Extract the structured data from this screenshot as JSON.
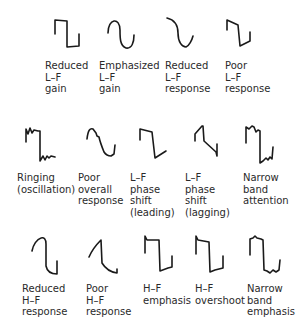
{
  "rows": [
    {
      "items": [
        {
          "id": "reduced-lf-gain",
          "lines": [
            "Reduced",
            "L–F",
            "gain"
          ]
        },
        {
          "id": "emphasized-lf-gain",
          "lines": [
            "Emphasized",
            "L–F",
            "gain"
          ]
        },
        {
          "id": "reduced-lf-response",
          "lines": [
            "Reduced",
            "L–F",
            "response"
          ]
        },
        {
          "id": "poor-lf-response",
          "lines": [
            "Poor",
            "L–F",
            "response"
          ]
        }
      ]
    },
    {
      "items": [
        {
          "id": "ringing",
          "lines": [
            "Ringing",
            "(oscillation)"
          ]
        },
        {
          "id": "poor-overall-response",
          "lines": [
            "Poor",
            "overall",
            "response"
          ]
        },
        {
          "id": "lf-phase-shift-leading",
          "lines": [
            "L–F",
            "phase",
            "shift",
            "(leading)"
          ]
        },
        {
          "id": "lf-phase-shift-lagging",
          "lines": [
            "L–F",
            "phase",
            "shift",
            "(lagging)"
          ]
        },
        {
          "id": "narrow-band-attention",
          "lines": [
            "Narrow",
            "band",
            "attention"
          ]
        }
      ]
    },
    {
      "items": [
        {
          "id": "reduced-hf-response",
          "lines": [
            "Reduced",
            "H–F",
            "response"
          ]
        },
        {
          "id": "poor-hf-response",
          "lines": [
            "Poor",
            "H–F",
            "response"
          ]
        },
        {
          "id": "hf-emphasis",
          "lines": [
            "H–F",
            "emphasis"
          ]
        },
        {
          "id": "hf-overshoot",
          "lines": [
            "H–F",
            "overshoot"
          ]
        },
        {
          "id": "narrow-band-emphasis",
          "lines": [
            "Narrow",
            "band",
            "emphasis"
          ]
        }
      ]
    }
  ],
  "colors": {
    "stroke": "#1a1a1a",
    "text": "#2a2a2a",
    "background": "#ffffff"
  }
}
